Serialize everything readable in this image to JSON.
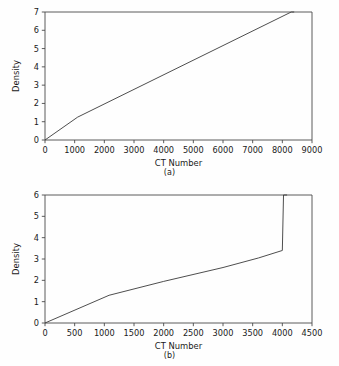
{
  "figure": {
    "background_color": "#fefefe",
    "line_color": "#3a3a3a",
    "axis_color": "#4a4a4a"
  },
  "panels": [
    {
      "id": "a",
      "caption": "(a)"
    },
    {
      "id": "b",
      "caption": "(b)"
    }
  ],
  "chart_data": [
    {
      "type": "line",
      "title": "",
      "subtitle": "",
      "panel_label": "(a)",
      "xlabel": "CT Number",
      "ylabel": "Density",
      "xlim": [
        0,
        9000
      ],
      "ylim": [
        0,
        7
      ],
      "xticks": [
        0,
        1000,
        2000,
        3000,
        4000,
        5000,
        6000,
        7000,
        8000,
        9000
      ],
      "xtick_labels": [
        "0",
        "1000",
        "2000",
        "3000",
        "4000",
        "5000",
        "6000",
        "7000",
        "8000",
        "9000"
      ],
      "yticks": [
        0,
        1,
        2,
        3,
        4,
        5,
        6,
        7
      ],
      "ytick_labels": [
        "0",
        "1",
        "2",
        "3",
        "4",
        "5",
        "6",
        "7"
      ],
      "grid": false,
      "legend": null,
      "series": [
        {
          "name": "CT-to-density calibration (a)",
          "x": [
            0,
            1100,
            8300,
            8400
          ],
          "y": [
            0.0,
            1.25,
            7.0,
            7.0
          ]
        }
      ],
      "annotations": []
    },
    {
      "type": "line",
      "title": "",
      "subtitle": "",
      "panel_label": "(b)",
      "xlabel": "CT Number",
      "ylabel": "Density",
      "xlim": [
        0,
        4500
      ],
      "ylim": [
        0,
        6
      ],
      "xticks": [
        0,
        500,
        1000,
        1500,
        2000,
        2500,
        3000,
        3500,
        4000,
        4500
      ],
      "xtick_labels": [
        "0",
        "500",
        "1000",
        "1500",
        "2000",
        "2500",
        "3000",
        "3500",
        "4000",
        "4500"
      ],
      "yticks": [
        0,
        1,
        2,
        3,
        4,
        5,
        6
      ],
      "ytick_labels": [
        "0",
        "1",
        "2",
        "3",
        "4",
        "5",
        "6"
      ],
      "grid": false,
      "legend": null,
      "series": [
        {
          "name": "CT-to-density calibration (b)",
          "x": [
            0,
            1080,
            2000,
            3000,
            3600,
            4000,
            4020,
            4080
          ],
          "y": [
            0.0,
            1.3,
            1.95,
            2.6,
            3.05,
            3.4,
            6.0,
            6.0
          ]
        }
      ],
      "annotations": []
    }
  ]
}
